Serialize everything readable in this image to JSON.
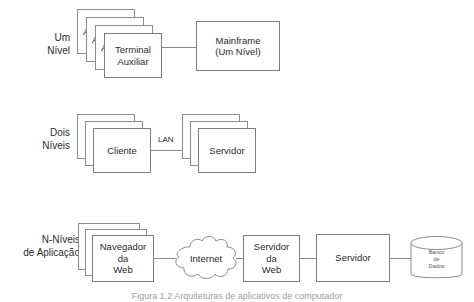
{
  "figure": {
    "caption": "Figura 1.2 Arquiteturas de aplicativos de computador",
    "line_color": "#8a8a8a",
    "box_border_color": "#7d7d7d",
    "text_color": "#2b2b2b",
    "background": "#ffffff"
  },
  "tiers": [
    {
      "id": "um-nivel",
      "label_lines": [
        "Um",
        "Nível"
      ],
      "nodes": [
        {
          "id": "terminal-auxiliar",
          "label_lines": [
            "Terminal",
            "Auxiliar"
          ],
          "stacked": true,
          "stack_count": 3,
          "ghost_text": "A"
        },
        {
          "id": "mainframe",
          "label_lines": [
            "Mainframe",
            "(Um Nível)"
          ],
          "stacked": false
        }
      ],
      "connector_label": ""
    },
    {
      "id": "dois-niveis",
      "label_lines": [
        "Dois",
        "Níveis"
      ],
      "nodes": [
        {
          "id": "cliente",
          "label_lines": [
            "Cliente"
          ],
          "stacked": true,
          "stack_count": 3,
          "ghost_text": ""
        },
        {
          "id": "servidor",
          "label_lines": [
            "Servidor"
          ],
          "stacked": true,
          "stack_count": 3,
          "ghost_text": ""
        }
      ],
      "connector_label": "LAN"
    },
    {
      "id": "n-niveis",
      "label_lines": [
        "N-Níveis",
        "de Aplicação"
      ],
      "nodes": [
        {
          "id": "navegador-da-web",
          "label_lines": [
            "Navegador",
            "da",
            "Web"
          ],
          "stacked": true,
          "stack_count": 3,
          "ghost_text": ""
        },
        {
          "id": "internet-cloud",
          "label_lines": [
            "Internet"
          ],
          "shape": "cloud"
        },
        {
          "id": "servidor-da-web",
          "label_lines": [
            "Servidor",
            "da",
            "Web"
          ],
          "stacked": false
        },
        {
          "id": "servidor-aplicacao",
          "label_lines": [
            "Servidor"
          ],
          "stacked": false
        },
        {
          "id": "banco-de-dados",
          "label_lines": [
            "Banco",
            "de",
            "Dados"
          ],
          "shape": "cylinder"
        }
      ],
      "connector_label": ""
    }
  ]
}
